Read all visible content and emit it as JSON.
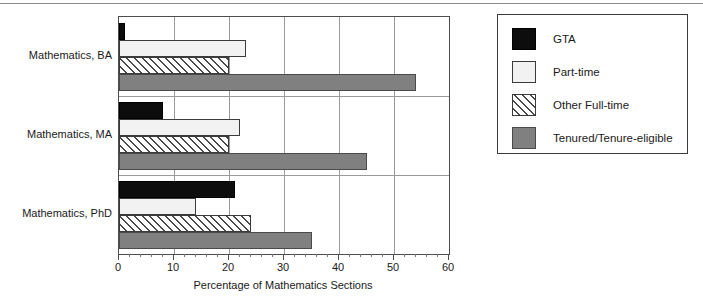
{
  "chart_data": {
    "type": "bar",
    "orientation": "horizontal",
    "title": "",
    "xlabel": "Percentage of Mathematics Sections",
    "ylabel": "",
    "categories": [
      "Mathematics, BA",
      "Mathematics, MA",
      "Mathematics, PhD"
    ],
    "series": [
      {
        "name": "GTA",
        "values": [
          1,
          8,
          21
        ],
        "color": "#0d0d0d",
        "fill": "solid-black"
      },
      {
        "name": "Part-time",
        "values": [
          23,
          22,
          14
        ],
        "color": "#f2f2f2",
        "fill": "solid-light"
      },
      {
        "name": "Other Full-time",
        "values": [
          20,
          20,
          24
        ],
        "color": "#ffffff",
        "fill": "diagonal-hatch"
      },
      {
        "name": "Tenured/Tenure-eligible",
        "values": [
          54,
          45,
          35
        ],
        "color": "#808080",
        "fill": "solid-gray"
      }
    ],
    "xlim": [
      0,
      60
    ],
    "xticks": [
      0,
      10,
      20,
      30,
      40,
      50,
      60
    ],
    "xticklabels": [
      "0",
      "10",
      "20",
      "30",
      "40",
      "50",
      "60"
    ],
    "xminortick_interval": 2,
    "grid": "vertical-major-and-group-separators",
    "legend_position": "right-outside",
    "legend_entries": [
      "GTA",
      "Part-time",
      "Other Full-time",
      "Tenured/Tenure-eligible"
    ]
  },
  "figure": {
    "axis_title": "Percentage of Mathematics Sections"
  },
  "legend": {
    "items": [
      {
        "label": "GTA"
      },
      {
        "label": "Part-time"
      },
      {
        "label": "Other Full-time"
      },
      {
        "label": "Tenured/Tenure-eligible"
      }
    ]
  }
}
